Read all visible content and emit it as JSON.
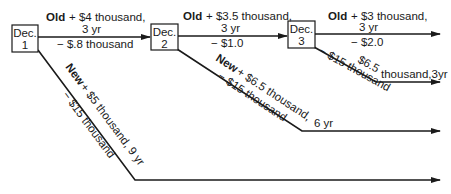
{
  "nodes": [
    {
      "id": "dec1",
      "label_top": "Dec.",
      "label_bottom": "1"
    },
    {
      "id": "dec2",
      "label_top": "Dec.",
      "label_bottom": "2"
    },
    {
      "id": "dec3",
      "label_top": "Dec.",
      "label_bottom": "3"
    }
  ],
  "edges": {
    "dec1_old": {
      "choice": "Old",
      "gain": "+ $4 thousand,",
      "duration": "3 yr",
      "cost": "− $.8 thousand"
    },
    "dec2_old": {
      "choice": "Old",
      "gain": "+ $3.5 thousand,",
      "duration": "3 yr",
      "cost": "− $1.0"
    },
    "dec3_old": {
      "choice": "Old",
      "gain": "+ $3 thousand,",
      "duration": "3 yr",
      "cost": "− $2.0"
    },
    "dec3_new": {
      "gain_part1": "$6.5",
      "gain_part2": "thousand,3yr",
      "cost": "− $15 thousand"
    },
    "dec2_new": {
      "choice": "New",
      "gain": "+ $6.5 thousand,",
      "cost": "− $15 thousand",
      "duration": "6 yr"
    },
    "dec1_new": {
      "choice": "New",
      "gain": "+ $5 thousand, 9 yr",
      "cost": "− $15 thousand"
    }
  }
}
